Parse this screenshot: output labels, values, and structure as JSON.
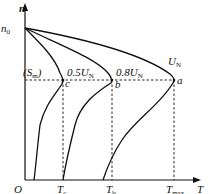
{
  "diagram": {
    "axes": {
      "y_label": "n",
      "x_label": "T",
      "origin_label": "O"
    },
    "y_ticks": [
      {
        "main": "n",
        "sub": "0"
      }
    ],
    "x_ticks": [
      {
        "main": "T",
        "sub": "c"
      },
      {
        "main": "T",
        "sub": "b"
      },
      {
        "main": "T",
        "sub": "max"
      }
    ],
    "curves": [
      {
        "name": "U_N",
        "main": "U",
        "sub": "N",
        "point": "a"
      },
      {
        "name": "0.8U_N",
        "main": "0.8U",
        "sub": "N",
        "point": "b"
      },
      {
        "name": "0.5U_N",
        "main": "0.5U",
        "sub": "N",
        "point": "c"
      }
    ],
    "slip_label": {
      "open": "(S",
      "sub": "m",
      "close": ")"
    },
    "points": {
      "a": "a",
      "b": "b",
      "c": "c"
    }
  }
}
